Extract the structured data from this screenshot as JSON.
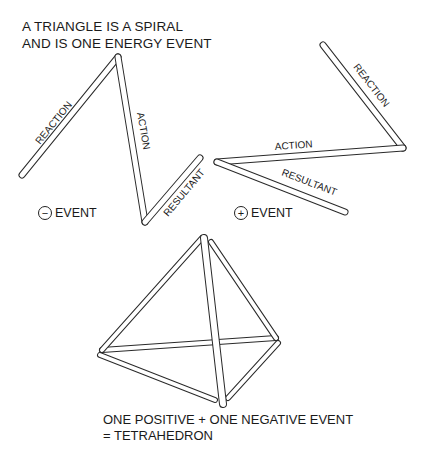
{
  "title": {
    "line1": "A TRIANGLE IS A SPIRAL",
    "line2": "AND IS ONE ENERGY EVENT"
  },
  "left_triangle": {
    "edges": [
      {
        "label": "REACTION",
        "from": [
          22,
          175
        ],
        "to": [
          118,
          57
        ]
      },
      {
        "label": "ACTION",
        "from": [
          118,
          57
        ],
        "to": [
          145,
          222
        ]
      },
      {
        "label": "RESULTANT",
        "from": [
          145,
          222
        ],
        "to": [
          200,
          158
        ]
      }
    ],
    "event": {
      "symbol": "−",
      "label": "EVENT",
      "sign": "negative"
    }
  },
  "right_triangle": {
    "edges": [
      {
        "label": "REACTION",
        "from": [
          323,
          45
        ],
        "to": [
          403,
          148
        ]
      },
      {
        "label": "ACTION",
        "from": [
          403,
          148
        ],
        "to": [
          217,
          162
        ]
      },
      {
        "label": "RESULTANT",
        "from": [
          217,
          162
        ],
        "to": [
          345,
          212
        ]
      }
    ],
    "event": {
      "symbol": "+",
      "label": "EVENT",
      "sign": "positive"
    }
  },
  "tetrahedron": {
    "vertices": {
      "apex": [
        204,
        237
      ],
      "left": [
        101,
        352
      ],
      "right": [
        277,
        341
      ],
      "bottom": [
        222,
        404
      ]
    }
  },
  "caption": {
    "line1": "ONE POSITIVE + ONE NEGATIVE EVENT",
    "line2": "= TETRAHEDRON"
  }
}
